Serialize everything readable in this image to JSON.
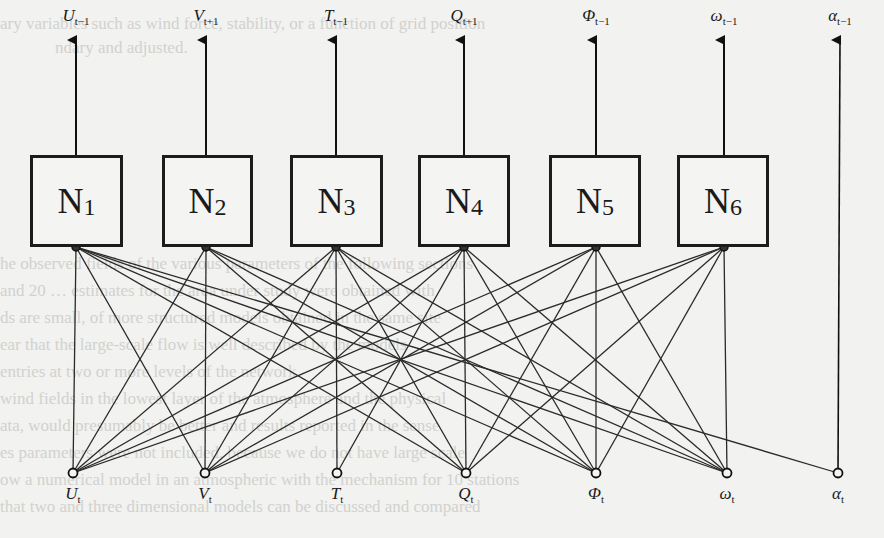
{
  "diagram": {
    "colors": {
      "line": "#2a2a2a",
      "box_border": "#1c1c1c",
      "background": "#f2f2f0"
    },
    "networks": [
      {
        "id": "N1",
        "base": "N",
        "sub": "1",
        "x": 30,
        "w": 93,
        "center": 76
      },
      {
        "id": "N2",
        "base": "N",
        "sub": "2",
        "x": 162,
        "w": 91,
        "center": 206
      },
      {
        "id": "N3",
        "base": "N",
        "sub": "3",
        "x": 290,
        "w": 93,
        "center": 336
      },
      {
        "id": "N4",
        "base": "N",
        "sub": "4",
        "x": 418,
        "w": 92,
        "center": 464
      },
      {
        "id": "N5",
        "base": "N",
        "sub": "5",
        "x": 549,
        "w": 92,
        "center": 596
      },
      {
        "id": "N6",
        "base": "N",
        "sub": "6",
        "x": 677,
        "w": 92,
        "center": 724
      }
    ],
    "box_top": 155,
    "box_bottom": 247,
    "outputs": [
      {
        "base": "U",
        "sub": "t−1",
        "x": 76
      },
      {
        "base": "V",
        "sub": "t+1",
        "x": 206
      },
      {
        "base": "T",
        "sub": "t−1",
        "x": 336
      },
      {
        "base": "Q",
        "sub": "t+1",
        "x": 464
      },
      {
        "base": "Φ",
        "sub": "t−1",
        "x": 596
      },
      {
        "base": "ω",
        "sub": "t−1",
        "x": 724
      },
      {
        "base": "α",
        "sub": "t−1",
        "x": 840
      }
    ],
    "inputs": [
      {
        "id": "U",
        "base": "U",
        "sub": "t",
        "x": 73
      },
      {
        "id": "V",
        "base": "V",
        "sub": "t",
        "x": 205
      },
      {
        "id": "T",
        "base": "T",
        "sub": "t",
        "x": 337
      },
      {
        "id": "Q",
        "base": "Q",
        "sub": "t",
        "x": 466
      },
      {
        "id": "Phi",
        "base": "Φ",
        "sub": "t",
        "x": 596
      },
      {
        "id": "w",
        "base": "ω",
        "sub": "t",
        "x": 727
      },
      {
        "id": "a",
        "base": "α",
        "sub": "t",
        "x": 838
      }
    ],
    "input_y": 473,
    "edges": [
      [
        0,
        0
      ],
      [
        0,
        1
      ],
      [
        0,
        3
      ],
      [
        0,
        4
      ],
      [
        0,
        5
      ],
      [
        0,
        6
      ],
      [
        1,
        0
      ],
      [
        1,
        1
      ],
      [
        1,
        3
      ],
      [
        1,
        4
      ],
      [
        1,
        5
      ],
      [
        2,
        0
      ],
      [
        2,
        1
      ],
      [
        2,
        2
      ],
      [
        2,
        3
      ],
      [
        2,
        4
      ],
      [
        2,
        5
      ],
      [
        3,
        0
      ],
      [
        3,
        1
      ],
      [
        3,
        2
      ],
      [
        3,
        3
      ],
      [
        3,
        4
      ],
      [
        3,
        5
      ],
      [
        4,
        0
      ],
      [
        4,
        1
      ],
      [
        4,
        3
      ],
      [
        4,
        4
      ],
      [
        4,
        5
      ],
      [
        5,
        0
      ],
      [
        5,
        1
      ],
      [
        5,
        3
      ],
      [
        5,
        4
      ],
      [
        5,
        5
      ]
    ],
    "alpha_passthrough": {
      "from_input": 6,
      "to_output": 6
    }
  },
  "background_text": [
    {
      "text": "ary variables such as wind force, stability, or a function of grid position",
      "x": 0,
      "y": 28
    },
    {
      "text": "ndary and adjusted.",
      "x": 55,
      "y": 52
    },
    {
      "text": "he observed fields of the various parameters of the following sections",
      "x": 0,
      "y": 268
    },
    {
      "text": "and 20 … estimates for the area under study were obtained with",
      "x": 0,
      "y": 295
    },
    {
      "text": "ds are small, of more structured models obtained in the same site",
      "x": 0,
      "y": 322
    },
    {
      "text": "ear that the large-scale flow is well described by the models",
      "x": 0,
      "y": 349
    },
    {
      "text": "entries at two or more levels of the network",
      "x": 0,
      "y": 376
    },
    {
      "text": "wind fields in the lowest layer of the atmosphere and the physical",
      "x": 0,
      "y": 403
    },
    {
      "text": "ata, would presumably be better and results reported in the sense",
      "x": 0,
      "y": 430
    },
    {
      "text": "es parameters were not included, because we do not have large scale",
      "x": 0,
      "y": 457
    },
    {
      "text": "ow a numerical model in an atmospheric with the mechanism for 10 stations",
      "x": 0,
      "y": 484
    },
    {
      "text": "that two and three dimensional models can be discussed and compared",
      "x": 0,
      "y": 511
    }
  ]
}
